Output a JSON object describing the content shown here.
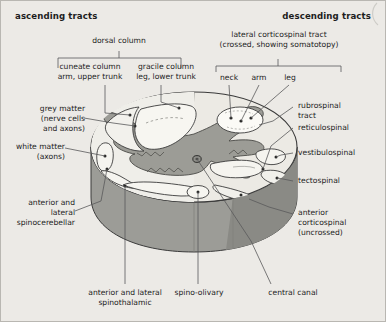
{
  "figure": {
    "title_ascending": "ascending tracts",
    "title_descending": "descending tracts",
    "background_color": "#eceae6",
    "grey_matter_color": "#9a9a95",
    "white_matter_color": "#e8e7e2",
    "tract_highlight_color": "#f5f4ef",
    "outline_color": "#3b3b3b",
    "side_shade_color": "#8d8d88",
    "leader_color": "#4a4a48"
  },
  "headers": {
    "ascending": "ascending tracts",
    "descending": "descending tracts"
  },
  "brackets": {
    "dorsal_column": {
      "label": "dorsal column",
      "subdivisions": [
        {
          "label_line1": "cuneate column",
          "label_line2": "arm, upper trunk"
        },
        {
          "label_line1": "gracile column",
          "label_line2": "leg, lower trunk"
        }
      ]
    },
    "lateral_corticospinal": {
      "label_line1": "lateral corticospinal tract",
      "label_line2": "(crossed, showing somatotopy)",
      "somatotopy": [
        "neck",
        "arm",
        "leg"
      ]
    }
  },
  "labels_left": [
    {
      "lines": [
        "grey matter",
        "(nerve cells",
        "and axons)"
      ]
    },
    {
      "lines": [
        "white matter",
        "(axons)"
      ]
    },
    {
      "lines": [
        "anterior and",
        "lateral",
        "spinocerebellar"
      ]
    }
  ],
  "labels_right": [
    {
      "lines": [
        "rubrospinal",
        "tract"
      ]
    },
    {
      "lines": [
        "reticulospinal"
      ]
    },
    {
      "lines": [
        "vestibulospinal"
      ]
    },
    {
      "lines": [
        "tectospinal"
      ]
    },
    {
      "lines": [
        "anterior",
        "corticospinal",
        "(uncrossed)"
      ]
    }
  ],
  "labels_bottom": [
    {
      "lines": [
        "anterior and lateral",
        "spinothalamic"
      ]
    },
    {
      "lines": [
        "spino-olivary"
      ]
    },
    {
      "lines": [
        "central canal"
      ]
    }
  ]
}
